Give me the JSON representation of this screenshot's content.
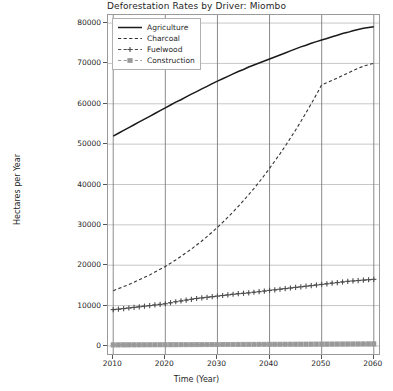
{
  "chart_data": {
    "type": "line",
    "title": "Deforestation Rates by Driver: Miombo",
    "xlabel": "Time (Year)",
    "ylabel": "Hectares per Year",
    "xlim": [
      2009,
      2061
    ],
    "ylim": [
      -2000,
      82000
    ],
    "grid": true,
    "legend_position": "upper left",
    "xticks": [
      2010,
      2020,
      2030,
      2040,
      2050,
      2060
    ],
    "xtick_labels": [
      "2010",
      "2020",
      "2030",
      "2040",
      "2050",
      "2060"
    ],
    "yticks": [
      0,
      10000,
      20000,
      30000,
      40000,
      50000,
      60000,
      70000,
      80000
    ],
    "ytick_labels": [
      "0",
      "10000",
      "20000",
      "30000",
      "40000",
      "50000",
      "60000",
      "70000",
      "80000"
    ],
    "x": [
      2010,
      2011,
      2012,
      2013,
      2014,
      2015,
      2016,
      2017,
      2018,
      2019,
      2020,
      2021,
      2022,
      2023,
      2024,
      2025,
      2026,
      2027,
      2028,
      2029,
      2030,
      2031,
      2032,
      2033,
      2034,
      2035,
      2036,
      2037,
      2038,
      2039,
      2040,
      2041,
      2042,
      2043,
      2044,
      2045,
      2046,
      2047,
      2048,
      2049,
      2050,
      2051,
      2052,
      2053,
      2054,
      2055,
      2056,
      2057,
      2058,
      2059,
      2060
    ],
    "series": [
      {
        "name": "Agriculture",
        "color": "#1a1a1a",
        "linestyle": "solid",
        "marker": "none",
        "values": [
          52000,
          52700,
          53400,
          54100,
          54800,
          55500,
          56200,
          56900,
          57600,
          58300,
          59000,
          59700,
          60400,
          61000,
          61700,
          62400,
          63000,
          63700,
          64300,
          65000,
          65600,
          66200,
          66800,
          67400,
          68000,
          68500,
          69100,
          69600,
          70100,
          70600,
          71100,
          71600,
          72100,
          72600,
          73100,
          73600,
          74100,
          74500,
          75000,
          75400,
          75800,
          76200,
          76600,
          77000,
          77400,
          77700,
          78100,
          78400,
          78700,
          78900,
          79100
        ]
      },
      {
        "name": "Charcoal",
        "color": "#333333",
        "linestyle": "dashed",
        "marker": "none",
        "values": [
          13700,
          14200,
          14700,
          15200,
          15800,
          16400,
          17000,
          17600,
          18300,
          19000,
          19700,
          20500,
          21300,
          22200,
          23100,
          24000,
          25000,
          26000,
          27100,
          28200,
          29400,
          30600,
          31900,
          33200,
          34600,
          36000,
          37500,
          39000,
          40600,
          42300,
          44000,
          45800,
          47600,
          49500,
          51500,
          53500,
          55600,
          57800,
          60000,
          62300,
          64700,
          65200,
          65800,
          66400,
          67000,
          67600,
          68200,
          68800,
          69300,
          69700,
          70000
        ]
      },
      {
        "name": "Fuelwood",
        "color": "#4d4d4d",
        "linestyle": "dashed",
        "marker": "plus",
        "values": [
          9000,
          9100,
          9250,
          9400,
          9550,
          9700,
          9850,
          10000,
          10150,
          10300,
          10450,
          10700,
          10950,
          11150,
          11350,
          11550,
          11750,
          11900,
          12050,
          12200,
          12350,
          12500,
          12650,
          12800,
          12950,
          13050,
          13150,
          13300,
          13450,
          13600,
          13750,
          13900,
          14050,
          14200,
          14350,
          14500,
          14650,
          14800,
          14950,
          15100,
          15250,
          15400,
          15550,
          15700,
          15850,
          16000,
          16100,
          16200,
          16300,
          16400,
          16500
        ]
      },
      {
        "name": "Construction",
        "color": "#999999",
        "linestyle": "dashed",
        "marker": "square",
        "values": [
          250,
          255,
          260,
          265,
          270,
          275,
          280,
          285,
          290,
          295,
          300,
          305,
          310,
          315,
          320,
          325,
          330,
          335,
          340,
          345,
          350,
          355,
          360,
          365,
          370,
          375,
          380,
          385,
          390,
          395,
          400,
          405,
          410,
          415,
          420,
          425,
          430,
          435,
          440,
          445,
          450,
          455,
          460,
          465,
          470,
          475,
          480,
          485,
          490,
          495,
          500
        ]
      }
    ]
  }
}
